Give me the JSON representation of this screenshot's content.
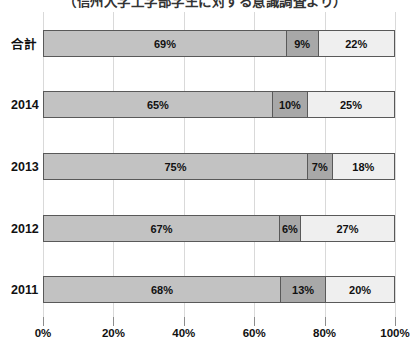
{
  "title": {
    "text": "（信州大学工学部学生に対する意識調査より）",
    "note": "title is clipped at top edge of screenshot; only bottom sliver of glyphs visible"
  },
  "chart_data": {
    "type": "bar",
    "orientation": "horizontal",
    "stacked": true,
    "categories": [
      "合計",
      "2014",
      "2013",
      "2012",
      "2011"
    ],
    "series": [
      {
        "name": "segment-1-medium-gray",
        "values": [
          69,
          65,
          75,
          67,
          68
        ]
      },
      {
        "name": "segment-2-dark-gray",
        "values": [
          9,
          10,
          7,
          6,
          13
        ]
      },
      {
        "name": "segment-3-light-gray",
        "values": [
          22,
          25,
          18,
          27,
          20
        ]
      }
    ],
    "data_labels": [
      [
        "69%",
        "9%",
        "22%"
      ],
      [
        "65%",
        "10%",
        "25%"
      ],
      [
        "75%",
        "7%",
        "18%"
      ],
      [
        "67%",
        "6%",
        "27%"
      ],
      [
        "68%",
        "13%",
        "20%"
      ]
    ],
    "xlabel": "",
    "ylabel": "",
    "xlim": [
      0,
      100
    ],
    "x_ticks": [
      "0%",
      "20%",
      "40%",
      "60%",
      "80%",
      "100%"
    ],
    "x_tick_values": [
      0,
      20,
      40,
      60,
      80,
      100
    ],
    "grid": "vertical-light-gray",
    "legend_position": "none-visible (clipped below bottom edge)"
  },
  "style": {
    "segment_colors": [
      "#c2c2c2",
      "#a8a8a8",
      "#efefef"
    ],
    "bar_border_color": "#595959",
    "grid_color": "#d9d9d9",
    "tick_color": "#8c8c8c",
    "text_color": "#111111",
    "background": "#ffffff"
  },
  "layout": {
    "bar_row_tops": [
      18,
      79,
      141,
      203,
      264
    ],
    "bar_height": 27
  }
}
